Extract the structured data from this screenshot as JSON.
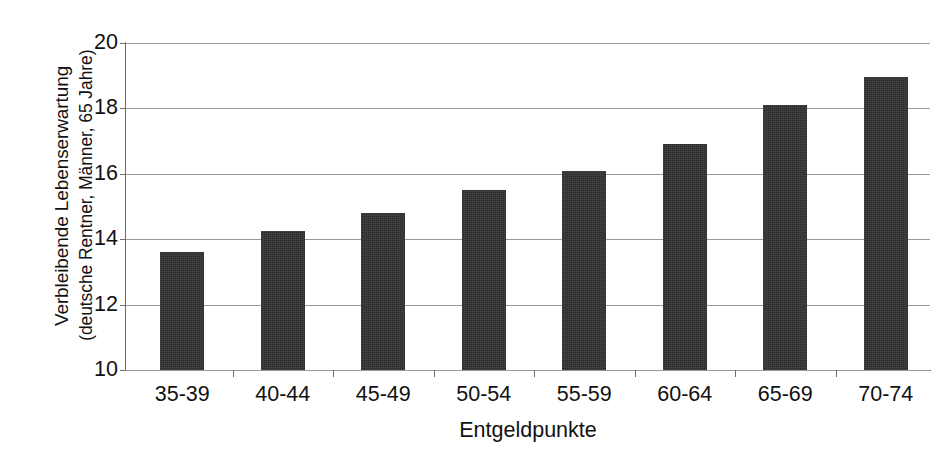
{
  "chart_data": {
    "type": "bar",
    "title": "",
    "subtitle": "",
    "xlabel": "Entgeldpunkte",
    "ylabel_line1": "Verbleibende Lebenserwartung",
    "ylabel_line2": "(deutsche Rentner, Männer, 65 Jahre)",
    "categories": [
      "35-39",
      "40-44",
      "45-49",
      "50-54",
      "55-59",
      "60-64",
      "65-69",
      "70-74"
    ],
    "values": [
      13.6,
      14.25,
      14.8,
      15.5,
      16.1,
      16.9,
      18.1,
      18.95
    ],
    "ylim": [
      10,
      20
    ],
    "yticks": [
      20,
      18,
      16,
      14,
      12,
      10
    ],
    "ytick_labels": [
      "20",
      "18",
      "16",
      "14",
      "12",
      "10"
    ],
    "grid": true,
    "legend": false,
    "legend_position": "none",
    "bar_color": "#2d2d2d",
    "gridline_color": "#9a9a9a",
    "axis_color": "#6e6e6e",
    "background_color": "#ffffff"
  }
}
